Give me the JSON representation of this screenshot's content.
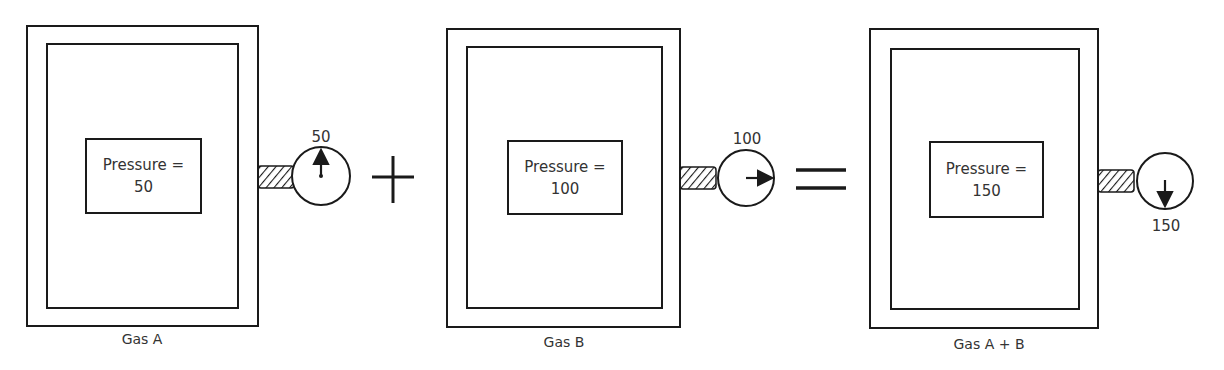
{
  "diagram": {
    "title": "",
    "containers": [
      {
        "id": "gas-a",
        "caption": "Gas A",
        "pressure_label": "Pressure =",
        "pressure_value": "50",
        "gauge_reading": "50",
        "needle_direction": "up"
      },
      {
        "id": "gas-b",
        "caption": "Gas B",
        "pressure_label": "Pressure =",
        "pressure_value": "100",
        "gauge_reading": "100",
        "needle_direction": "right"
      },
      {
        "id": "gas-ab",
        "caption": "Gas A + B",
        "pressure_label": "Pressure =",
        "pressure_value": "150",
        "gauge_reading": "150",
        "needle_direction": "down"
      }
    ],
    "operators": [
      {
        "symbol": "plus"
      },
      {
        "symbol": "equals"
      }
    ],
    "colors": {
      "stroke": "#1a1a1a",
      "text": "#333333",
      "background": "#ffffff"
    }
  }
}
